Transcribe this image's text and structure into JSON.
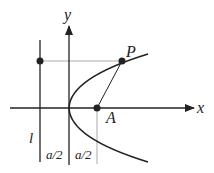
{
  "labels": {
    "y_axis": "y",
    "x_axis": "x",
    "point_p": "P",
    "point_a": "A",
    "directrix": "l",
    "dist_left": "a/2",
    "dist_right": "a/2"
  },
  "colors": {
    "ink": "#222222",
    "guide": "#aaaaaa"
  }
}
